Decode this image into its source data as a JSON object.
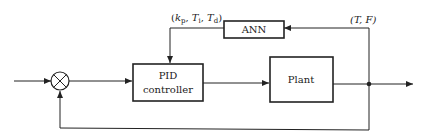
{
  "diagram": {
    "type": "block-diagram",
    "title": "",
    "blocks": {
      "ann": {
        "label": "ANN"
      },
      "pid": {
        "line1": "PID",
        "line2": "controller"
      },
      "plant": {
        "label": "Plant"
      }
    },
    "summing_junction": {
      "symbol": "⊗"
    },
    "signals": {
      "params": {
        "open": "(",
        "k": "k",
        "k_sub": "p",
        "sep1": ", ",
        "Ti": "T",
        "Ti_sub": "i",
        "sep2": ", ",
        "Td": "T",
        "Td_sub": "d",
        "close": ")"
      },
      "outputs": {
        "label": "(T, F)"
      }
    },
    "colors": {
      "stroke": "#222222",
      "background": "#ffffff"
    }
  }
}
